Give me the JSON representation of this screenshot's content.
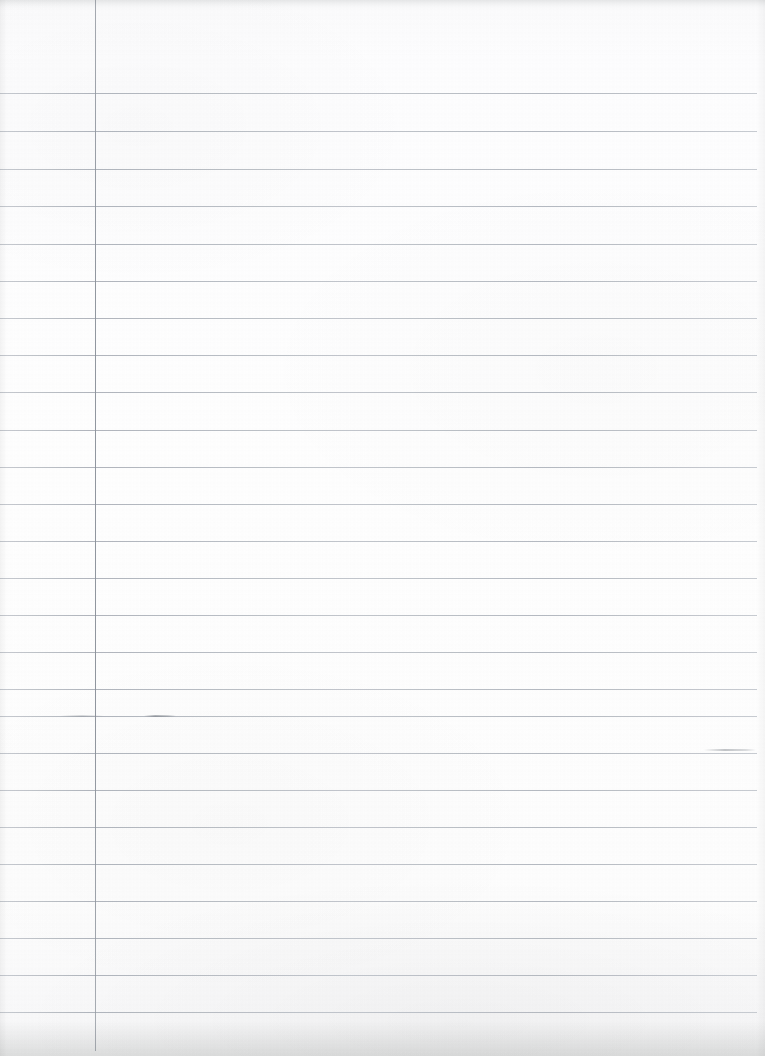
{
  "document": {
    "kind": "ruled-notebook-page",
    "title": "Blank lined notebook page",
    "content_text": "",
    "page_width": 765,
    "page_height": 1056,
    "orientation": "portrait"
  },
  "paper": {
    "background_color": "#fdfdfd",
    "edge_shadow_color": "#eceded",
    "texture": "scanned paper grain"
  },
  "ruling": {
    "line_color": "#c3c7cd",
    "line_thickness_px": 1,
    "line_spacing_px": 38,
    "first_line_y": 93,
    "line_count": 25,
    "line_left_x": 0,
    "line_right_x": 757,
    "line_positions": [
      93,
      131,
      169,
      206,
      244,
      281,
      318,
      355,
      392,
      430,
      467,
      504,
      541,
      578,
      615,
      652,
      689,
      716,
      753,
      790,
      827,
      864,
      901,
      938,
      975,
      1012
    ]
  },
  "margin_rule": {
    "color": "#8c929b",
    "x": 95,
    "top": 0,
    "bottom": 1051,
    "thickness_px": 1,
    "orientation": "vertical"
  },
  "marks": [
    {
      "name": "pencil-smudge-left",
      "x": 144,
      "y": 715,
      "width": 32,
      "height": 2
    },
    {
      "name": "pencil-smudge-right",
      "x": 704,
      "y": 749,
      "width": 52,
      "height": 2
    },
    {
      "name": "pencil-smudge-faint",
      "x": 60,
      "y": 715,
      "width": 44,
      "height": 2
    }
  ],
  "regions": {
    "margin_column_label": "left margin column",
    "writing_area_label": "ruled writing area"
  }
}
